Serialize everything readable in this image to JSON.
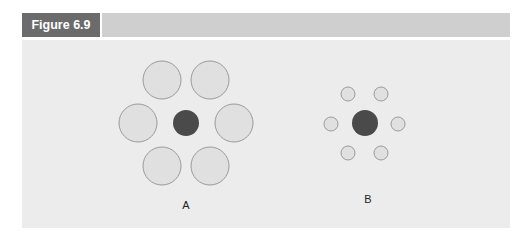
{
  "figure": {
    "label": "Figure 6.9",
    "colors": {
      "header_bar": "#cfcfcf",
      "label_box": "#6b6b6b",
      "panel": "#ececec",
      "surround_fill": "#e0e0e0",
      "surround_stroke": "#9a9a9a",
      "center_fill": "#4a4a4a"
    }
  },
  "diagram": {
    "groups": [
      {
        "label": "A",
        "center": {
          "cx": 186,
          "cy": 123,
          "r": 13
        },
        "surround_radius": 19,
        "surround": [
          [
            162,
            80
          ],
          [
            210,
            80
          ],
          [
            138,
            123
          ],
          [
            234,
            123
          ],
          [
            162,
            166
          ],
          [
            210,
            166
          ]
        ],
        "label_pos": [
          186,
          199
        ]
      },
      {
        "label": "B",
        "center": {
          "cx": 365,
          "cy": 123,
          "r": 13
        },
        "surround_radius": 7,
        "surround": [
          [
            348,
            94
          ],
          [
            381,
            94
          ],
          [
            331,
            124
          ],
          [
            398,
            124
          ],
          [
            348,
            153
          ],
          [
            381,
            153
          ]
        ],
        "label_pos": [
          368,
          193
        ]
      }
    ]
  }
}
